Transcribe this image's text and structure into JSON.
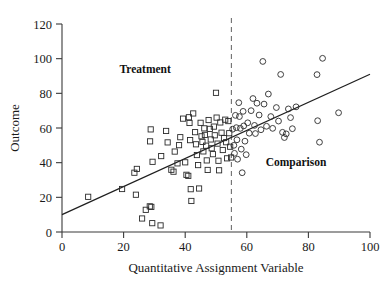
{
  "chart_data": {
    "type": "scatter",
    "title": "",
    "xlabel": "Quantitative Assignment Variable",
    "ylabel": "Outcome",
    "xlim": [
      0,
      100
    ],
    "ylim": [
      0,
      120
    ],
    "xticks": [
      0,
      20,
      40,
      60,
      80,
      100
    ],
    "yticks": [
      0,
      20,
      40,
      60,
      80,
      100,
      120
    ],
    "grid": false,
    "legend": "none",
    "annotations": [
      {
        "text": "Treatment",
        "x": 27,
        "y": 92,
        "bold": true
      },
      {
        "text": "Comparison",
        "x": 76,
        "y": 38,
        "bold": true
      }
    ],
    "cutoff": {
      "x": 55,
      "style": "dashed",
      "color": "#707070"
    },
    "fit_line": {
      "x": [
        0,
        100
      ],
      "y": [
        10,
        91
      ],
      "slope": 0.81,
      "intercept": 10,
      "color": "#1f1f1f"
    },
    "series": [
      {
        "name": "Treatment",
        "marker": "square",
        "points": [
          [
            8.5,
            20.3
          ],
          [
            19.5,
            24.8
          ],
          [
            23.5,
            34.2
          ],
          [
            24.3,
            36.4
          ],
          [
            24.0,
            21.5
          ],
          [
            26.0,
            7.8
          ],
          [
            27.2,
            12.8
          ],
          [
            28.5,
            14.8
          ],
          [
            29.0,
            14.5
          ],
          [
            29.3,
            5.1
          ],
          [
            28.8,
            59.2
          ],
          [
            28.6,
            52.3
          ],
          [
            29.4,
            40.5
          ],
          [
            32.0,
            3.8
          ],
          [
            32.2,
            43.8
          ],
          [
            33.8,
            58.3
          ],
          [
            34.3,
            51.7
          ],
          [
            35.5,
            35.9
          ],
          [
            36.2,
            34.8
          ],
          [
            36.6,
            46.4
          ],
          [
            37.5,
            39.6
          ],
          [
            38.0,
            50.1
          ],
          [
            38.4,
            54.7
          ],
          [
            39.3,
            65.4
          ],
          [
            40.0,
            40.2
          ],
          [
            40.4,
            33.0
          ],
          [
            41.0,
            32.4
          ],
          [
            41.2,
            66.2
          ],
          [
            41.4,
            62.9
          ],
          [
            41.6,
            53.0
          ],
          [
            41.8,
            24.7
          ],
          [
            42.0,
            17.9
          ],
          [
            42.6,
            68.4
          ],
          [
            43.2,
            57.6
          ],
          [
            43.5,
            50.6
          ],
          [
            43.8,
            44.4
          ],
          [
            44.2,
            38.6
          ],
          [
            44.5,
            25.1
          ],
          [
            45.0,
            63.0
          ],
          [
            45.3,
            55.2
          ],
          [
            45.6,
            52.0
          ],
          [
            45.9,
            46.5
          ],
          [
            46.2,
            59.8
          ],
          [
            46.4,
            56.0
          ],
          [
            46.8,
            49.8
          ],
          [
            47.0,
            41.3
          ],
          [
            47.3,
            35.8
          ],
          [
            47.6,
            64.6
          ],
          [
            48.0,
            59.5
          ],
          [
            48.3,
            53.4
          ],
          [
            48.6,
            48.3
          ],
          [
            49.0,
            44.9
          ],
          [
            49.3,
            60.8
          ],
          [
            49.6,
            55.8
          ],
          [
            50.0,
            80.3
          ],
          [
            50.2,
            66.0
          ],
          [
            50.5,
            51.0
          ],
          [
            50.8,
            41.1
          ],
          [
            51.0,
            35.6
          ],
          [
            51.4,
            63.2
          ],
          [
            51.8,
            57.3
          ],
          [
            52.2,
            47.3
          ],
          [
            52.6,
            54.2
          ],
          [
            53.0,
            64.8
          ],
          [
            53.3,
            51.8
          ],
          [
            53.6,
            42.5
          ],
          [
            54.0,
            64.0
          ],
          [
            54.3,
            57.0
          ],
          [
            54.6,
            49.2
          ],
          [
            54.9,
            43.0
          ]
        ]
      },
      {
        "name": "Comparison",
        "marker": "circle",
        "points": [
          [
            55.4,
            59.3
          ],
          [
            55.8,
            50.0
          ],
          [
            56.0,
            45.4
          ],
          [
            56.3,
            67.3
          ],
          [
            56.6,
            60.2
          ],
          [
            56.8,
            53.2
          ],
          [
            57.0,
            42.0
          ],
          [
            57.4,
            74.6
          ],
          [
            57.6,
            66.6
          ],
          [
            57.9,
            59.8
          ],
          [
            58.2,
            47.8
          ],
          [
            58.5,
            34.2
          ],
          [
            58.8,
            69.6
          ],
          [
            59.0,
            61.2
          ],
          [
            59.4,
            52.4
          ],
          [
            59.8,
            44.6
          ],
          [
            60.3,
            63.0
          ],
          [
            60.8,
            57.0
          ],
          [
            61.4,
            70.0
          ],
          [
            62.0,
            77.0
          ],
          [
            62.5,
            61.5
          ],
          [
            62.8,
            56.8
          ],
          [
            63.3,
            74.3
          ],
          [
            64.0,
            67.5
          ],
          [
            64.6,
            59.0
          ],
          [
            65.2,
            98.4
          ],
          [
            65.6,
            73.8
          ],
          [
            66.4,
            61.0
          ],
          [
            67.0,
            79.6
          ],
          [
            67.8,
            66.6
          ],
          [
            68.4,
            59.8
          ],
          [
            69.6,
            71.8
          ],
          [
            70.3,
            64.0
          ],
          [
            71.0,
            90.9
          ],
          [
            71.6,
            57.5
          ],
          [
            72.2,
            54.5
          ],
          [
            72.8,
            56.6
          ],
          [
            73.5,
            71.0
          ],
          [
            74.2,
            66.0
          ],
          [
            74.8,
            59.6
          ],
          [
            76.0,
            72.2
          ],
          [
            82.8,
            90.8
          ],
          [
            83.0,
            64.2
          ],
          [
            83.6,
            51.8
          ],
          [
            84.6,
            100.2
          ],
          [
            89.8,
            68.8
          ]
        ]
      }
    ]
  }
}
